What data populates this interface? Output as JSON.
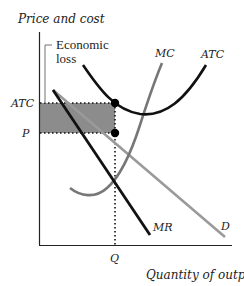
{
  "diagram": {
    "type": "economics-graph",
    "y_axis_label": "Price and cost",
    "x_axis_label": "Quantity of output",
    "annotation": {
      "line1": "Economic",
      "line2": "loss"
    },
    "y_ticks": {
      "atc": "ATC",
      "p": "P"
    },
    "x_ticks": {
      "q": "Q"
    },
    "curves": {
      "mc": "MC",
      "atc": "ATC",
      "demand": "D",
      "mr": "MR"
    },
    "colors": {
      "axis": "#222222",
      "mc": "#777777",
      "atc": "#111111",
      "demand": "#9a9a9a",
      "mr": "#111111",
      "loss_area": "#8c8c8c",
      "bracket": "#888888"
    }
  }
}
